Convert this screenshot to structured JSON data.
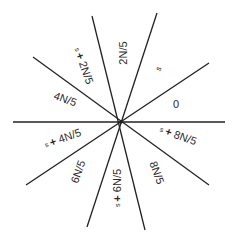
{
  "diagram": {
    "center": [
      121,
      122
    ],
    "line_color": "#222222",
    "lines": [
      {
        "x1": 92,
        "y1": 16,
        "x2": 145,
        "y2": 230
      },
      {
        "x1": 157,
        "y1": 13,
        "x2": 87,
        "y2": 227
      },
      {
        "x1": 209,
        "y1": 63,
        "x2": 26,
        "y2": 185
      },
      {
        "x1": 33,
        "y1": 57,
        "x2": 209,
        "y2": 185
      },
      {
        "x1": 13,
        "y1": 122,
        "x2": 225,
        "y2": 122
      }
    ],
    "sector_labels": [
      {
        "text": "2N/5",
        "x": 124,
        "y": 53,
        "rotate": -90
      },
      {
        "text": "s",
        "x": 159,
        "y": 69,
        "rotate": -60
      },
      {
        "text": "0",
        "x": 176,
        "y": 105,
        "rotate": 0
      },
      {
        "text": "s + 8N/5",
        "x": 178,
        "y": 136,
        "rotate": 20
      },
      {
        "text": "8N/5",
        "x": 156,
        "y": 173,
        "rotate": 70
      },
      {
        "text": "s + 6N/5",
        "x": 118,
        "y": 188,
        "rotate": -90
      },
      {
        "text": "6N/5",
        "x": 79,
        "y": 172,
        "rotate": -70
      },
      {
        "text": "s + 4N/5",
        "x": 63,
        "y": 139,
        "rotate": -20
      },
      {
        "text": "4N/5",
        "x": 65,
        "y": 100,
        "rotate": 20
      },
      {
        "text": "s + 2N/5",
        "x": 83,
        "y": 66,
        "rotate": 70
      }
    ]
  }
}
